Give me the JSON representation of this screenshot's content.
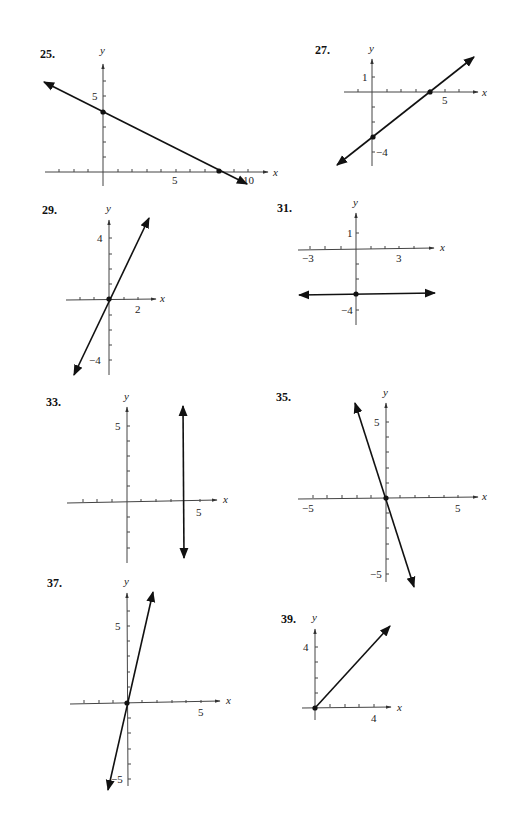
{
  "problems": [
    {
      "number": "25.",
      "x_label": "x",
      "y_label": "y",
      "tick_labels": {
        "y": [
          "5"
        ],
        "x": [
          "5",
          "10"
        ]
      },
      "line": "through (0,4) and (8,0), slope -1/2",
      "points": [
        [
          0,
          4
        ],
        [
          8,
          0
        ]
      ]
    },
    {
      "number": "27.",
      "x_label": "x",
      "y_label": "y",
      "tick_labels": {
        "y": [
          "1",
          "−4"
        ],
        "x": [
          "5"
        ]
      },
      "line": "through (0,-3) and (4,0), slope 3/4",
      "points": [
        [
          0,
          -3
        ],
        [
          4,
          0
        ]
      ]
    },
    {
      "number": "29.",
      "x_label": "x",
      "y_label": "y",
      "tick_labels": {
        "y": [
          "4",
          "−4"
        ],
        "x": [
          "2"
        ]
      },
      "line": "y = 2x",
      "points": [
        [
          0,
          0
        ]
      ]
    },
    {
      "number": "31.",
      "x_label": "x",
      "y_label": "y",
      "tick_labels": {
        "y": [
          "1",
          "−4"
        ],
        "x": [
          "−3",
          "3"
        ]
      },
      "line": "y = -3",
      "points": [
        [
          0,
          -3
        ]
      ]
    },
    {
      "number": "33.",
      "x_label": "x",
      "y_label": "y",
      "tick_labels": {
        "y": [
          "5"
        ],
        "x": [
          "5"
        ]
      },
      "line": "x = 4",
      "points": []
    },
    {
      "number": "35.",
      "x_label": "x",
      "y_label": "y",
      "tick_labels": {
        "y": [
          "5",
          "−5"
        ],
        "x": [
          "−5",
          "5"
        ]
      },
      "line": "y = -3x",
      "points": [
        [
          0,
          0
        ]
      ]
    },
    {
      "number": "37.",
      "x_label": "x",
      "y_label": "y",
      "tick_labels": {
        "y": [
          "5",
          "−5"
        ],
        "x": [
          "5"
        ]
      },
      "line": "y = 4x",
      "points": [
        [
          0,
          0
        ]
      ]
    },
    {
      "number": "39.",
      "x_label": "x",
      "y_label": "y",
      "tick_labels": {
        "y": [
          "4"
        ],
        "x": [
          "4"
        ]
      },
      "line": "ray y = x, x ≥ 0",
      "points": [
        [
          0,
          0
        ]
      ]
    }
  ]
}
